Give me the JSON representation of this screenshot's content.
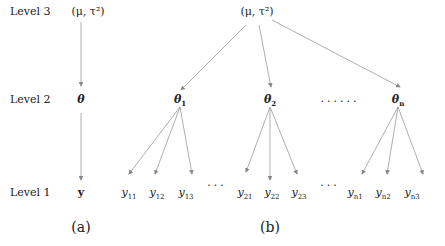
{
  "levels": {
    "level3": "Level 3",
    "level2": "Level 2",
    "level1": "Level 1"
  },
  "panel_a": {
    "caption": "(a)",
    "top": "(μ, τ²)",
    "mid": "θ",
    "bottom": "y"
  },
  "panel_b": {
    "caption": "(b)",
    "top": "(μ, τ²)",
    "thetas": [
      {
        "base": "θ",
        "sub": "1"
      },
      {
        "base": "θ",
        "sub": "2"
      },
      {
        "base": "θ",
        "sub": "n"
      }
    ],
    "theta_ellipsis": "......",
    "ys": [
      {
        "base": "y",
        "sub": "11"
      },
      {
        "base": "y",
        "sub": "12"
      },
      {
        "base": "y",
        "sub": "13"
      },
      {
        "base": "y",
        "sub": "21"
      },
      {
        "base": "y",
        "sub": "22"
      },
      {
        "base": "y",
        "sub": "23"
      },
      {
        "base": "y",
        "sub": "n1"
      },
      {
        "base": "y",
        "sub": "n2"
      },
      {
        "base": "y",
        "sub": "n3"
      }
    ],
    "y_ellipsis": "..."
  },
  "colors": {
    "line": "#888888",
    "text": "#222222"
  }
}
